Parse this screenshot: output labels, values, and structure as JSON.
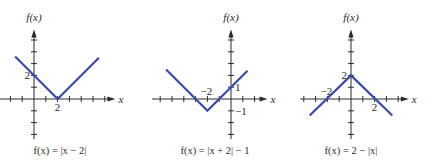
{
  "figure": {
    "curve_color": "#3a4aa8",
    "axis_color": "#2b2b2b"
  },
  "chart_data": [
    {
      "type": "line",
      "title": "f(x) = |x − 2|",
      "function": "|x - 2|",
      "xlabel": "x",
      "ylabel": "f(x)",
      "x": [
        -1.6,
        2,
        5.5
      ],
      "y": [
        3.6,
        0,
        3.5
      ],
      "vertex": [
        2,
        0
      ],
      "tick_labels": [
        {
          "axis": "x",
          "value": 2,
          "text": "2"
        },
        {
          "axis": "y",
          "value": 2,
          "text": "2"
        }
      ],
      "xlim": [
        -3,
        6.5
      ],
      "ylim": [
        -3.4,
        5.9
      ],
      "grid": false,
      "layout": {
        "ox": 34,
        "oy": 99,
        "unit": 11.8,
        "x_ticks": [
          -2,
          -1,
          1,
          2,
          3,
          4,
          5,
          6
        ],
        "y_ticks": [
          -3,
          -2,
          -1,
          1,
          2,
          3,
          4,
          5
        ],
        "x_axis_from": -2.9,
        "x_axis_to": 6.9,
        "y_axis_top": 5.9,
        "y_axis_bottom": -3.4,
        "caption_x": 60
      }
    },
    {
      "type": "line",
      "title": "f(x) = |x + 2| − 1",
      "function": "|x + 2| - 1",
      "xlabel": "x",
      "ylabel": "f(x)",
      "x": [
        -5.5,
        -2,
        1.4
      ],
      "y": [
        2.5,
        -1,
        2.4
      ],
      "vertex": [
        -2,
        -1
      ],
      "tick_labels": [
        {
          "axis": "x",
          "value": -2,
          "text": "−2"
        },
        {
          "axis": "y",
          "value": 1,
          "text": "1"
        },
        {
          "axis": "y",
          "value": -1,
          "text": "−1"
        }
      ],
      "xlim": [
        -6.7,
        2.9
      ],
      "ylim": [
        -3.4,
        5.9
      ],
      "grid": false,
      "layout": {
        "ox": 231,
        "oy": 99,
        "unit": 11.8,
        "x_ticks": [
          -6,
          -5,
          -4,
          -3,
          -2,
          -1,
          1,
          2
        ],
        "y_ticks": [
          -3,
          -2,
          -1,
          1,
          2,
          3,
          4,
          5
        ],
        "x_axis_from": -6.7,
        "x_axis_to": 3.1,
        "y_axis_top": 5.9,
        "y_axis_bottom": -3.4,
        "caption_x": 215
      }
    },
    {
      "type": "line",
      "title": "f(x) = 2 − |x|",
      "function": "2 - |x|",
      "xlabel": "x",
      "ylabel": "f(x)",
      "x": [
        -3.5,
        0,
        3.5
      ],
      "y": [
        -1.4,
        2,
        -1.4
      ],
      "vertex": [
        0,
        2
      ],
      "tick_labels": [
        {
          "axis": "x",
          "value": -2,
          "text": "−2"
        },
        {
          "axis": "x",
          "value": 2,
          "text": "2"
        },
        {
          "axis": "y",
          "value": 2,
          "text": "2"
        }
      ],
      "xlim": [
        -4.3,
        4.3
      ],
      "ylim": [
        -3.4,
        5.9
      ],
      "grid": false,
      "layout": {
        "ox": 351,
        "oy": 99,
        "unit": 11.8,
        "x_ticks": [
          -4,
          -3,
          -2,
          -1,
          1,
          2,
          3,
          4
        ],
        "y_ticks": [
          -3,
          -2,
          -1,
          1,
          2,
          3,
          4,
          5
        ],
        "x_axis_from": -4.3,
        "x_axis_to": 4.9,
        "y_axis_top": 5.9,
        "y_axis_bottom": -3.4,
        "caption_x": 351
      }
    }
  ]
}
